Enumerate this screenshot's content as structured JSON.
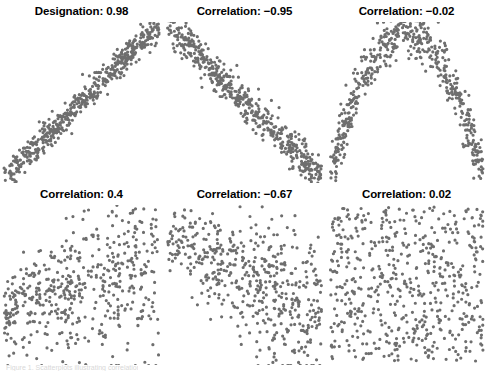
{
  "figure": {
    "name": "correlation-scatter-matrix",
    "background_color": "#ffffff",
    "point_color": "#6e6e6e",
    "title_color": "#000000",
    "point_radius": 1.6,
    "clipped_caption": "Figure 1. Scatterplots illustrating correlation"
  },
  "panels": [
    {
      "id": "panel-1",
      "label_prefix": "Designation:",
      "value": "0.98",
      "title": "Designation: 0.98",
      "shape": "linear-positive",
      "n": 520,
      "seed": 11,
      "r": 0.98
    },
    {
      "id": "panel-2",
      "label_prefix": "Correlation:",
      "value": "−0.95",
      "title": "Correlation: −0.95",
      "shape": "linear-negative",
      "n": 520,
      "seed": 27,
      "r": -0.95
    },
    {
      "id": "panel-3",
      "label_prefix": "Correlation:",
      "value": "−0.02",
      "title": "Correlation: −0.02",
      "shape": "arch",
      "n": 520,
      "seed": 43,
      "r": -0.02
    },
    {
      "id": "panel-4",
      "label_prefix": "Correlation:",
      "value": "0.4",
      "title": "Correlation: 0.4",
      "shape": "fan-positive",
      "n": 520,
      "seed": 61,
      "r": 0.4
    },
    {
      "id": "panel-5",
      "label_prefix": "Correlation:",
      "value": "−0.67",
      "title": "Correlation: −0.67",
      "shape": "fan-negative",
      "n": 520,
      "seed": 79,
      "r": -0.67
    },
    {
      "id": "panel-6",
      "label_prefix": "Correlation:",
      "value": "0.02",
      "title": "Correlation: 0.02",
      "shape": "uniform-random",
      "n": 560,
      "seed": 97,
      "r": 0.02
    }
  ],
  "chart_data": {
    "type": "scatter",
    "title": "",
    "layout": {
      "rows": 2,
      "cols": 3,
      "grid": false,
      "axes_visible": false,
      "legend": "none"
    },
    "xlabel": "",
    "ylabel": "",
    "xlim": [
      0,
      1
    ],
    "ylim": [
      0,
      1
    ],
    "series": [
      {
        "name": "Designation: 0.98",
        "r": 0.98,
        "n": 520,
        "pattern": "tight positive linear band from lower-left to upper-right"
      },
      {
        "name": "Correlation: −0.95",
        "r": -0.95,
        "n": 520,
        "pattern": "tight negative linear band from upper-left to lower-right"
      },
      {
        "name": "Correlation: −0.02",
        "r": -0.02,
        "n": 520,
        "pattern": "inverted-U arch, strong nonlinear dependence with near-zero linear correlation"
      },
      {
        "name": "Correlation: 0.4",
        "r": 0.4,
        "n": 520,
        "pattern": "diffuse positive trend, heteroscedastic fan widening to the right"
      },
      {
        "name": "Correlation: −0.67",
        "r": -0.67,
        "n": 520,
        "pattern": "moderate negative trend, dense upper-left thinning toward lower-right"
      },
      {
        "name": "Correlation: 0.02",
        "r": 0.02,
        "n": 560,
        "pattern": "uniform random cloud filling the square, no trend"
      }
    ]
  }
}
